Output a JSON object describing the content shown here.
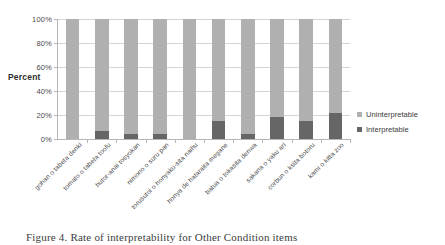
{
  "chart_data": {
    "type": "bar",
    "title": "",
    "subtitle": "",
    "xlabel": "",
    "ylabel": "Percent",
    "ylim": [
      0,
      100
    ],
    "ytick_labels": [
      "0%",
      "20%",
      "40%",
      "60%",
      "80%",
      "100%"
    ],
    "ytick_values": [
      0,
      20,
      40,
      60,
      80,
      100
    ],
    "grid": true,
    "stacked": true,
    "legend_position": "right",
    "categories": [
      "gohan o tabeta denki",
      "tomato o tabeta toofu",
      "hutor-anai tosyokan",
      "nimono o suru pan",
      "torusutoi o honyaku-sita naihu",
      "honya de hataraita megane",
      "batua o tokasita denwa",
      "sakana o yaku ari",
      "corbun o ksita botoru",
      "kami o kitta zoo"
    ],
    "series": [
      {
        "name": "Interpretable",
        "color": "#666666",
        "values": [
          0,
          7,
          4,
          4,
          0,
          15,
          4,
          18,
          15,
          22
        ]
      },
      {
        "name": "Uninterpretable",
        "color": "#b0b0b0",
        "values": [
          100,
          93,
          96,
          96,
          100,
          85,
          96,
          82,
          85,
          78
        ]
      }
    ],
    "legend": [
      "Uninterpretable",
      "Interpretable"
    ]
  },
  "axis": {
    "y_title": "Percent"
  },
  "legend": {
    "uninterpretable_label": "Uninterpretable",
    "interpretable_label": "Interpretable"
  },
  "caption": {
    "text": "Figure 4. Rate of interpretability for Other Condition items"
  }
}
